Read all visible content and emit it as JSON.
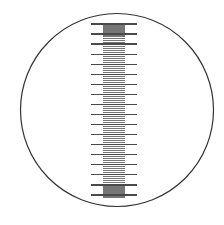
{
  "figure": {
    "width": 224,
    "height": 225,
    "background_color": "#ffffff"
  },
  "field_of_view": {
    "shape": "circle",
    "center_x": 117,
    "center_y": 110,
    "radius": 96.5,
    "stroke_color": "#333333",
    "stroke_width": 1.2,
    "fill": "none"
  },
  "chart_data": {
    "type": "scale",
    "orientation": "vertical",
    "axis_x": 114,
    "y_start": 24,
    "y_end": 197,
    "total_minor_divisions": 86,
    "minor_interval_px": 2.012,
    "major_every_n_minor": 5,
    "major_count": 18,
    "minor_tick": {
      "length": 22,
      "x_left": 103,
      "x_right": 125,
      "stroke_color": "#767676",
      "stroke_width": 1.15
    },
    "major_tick": {
      "length": 46,
      "x_left": 91,
      "x_right": 137,
      "stroke_color": "#4a4a4a",
      "stroke_width": 1.25
    },
    "major_tick_y_positions": [
      24.0,
      34.2,
      44.3,
      54.5,
      64.6,
      74.8,
      84.9,
      95.1,
      105.2,
      115.4,
      125.5,
      135.7,
      145.8,
      156.0,
      166.1,
      176.3,
      186.4,
      196.6
    ],
    "xlabel": "",
    "ylabel": "",
    "grid": false,
    "legend": null,
    "tick_labels": []
  },
  "colors": {
    "circle_stroke": "#333333",
    "minor_tick": "#767676",
    "major_tick": "#4a4a4a",
    "background": "#ffffff"
  }
}
